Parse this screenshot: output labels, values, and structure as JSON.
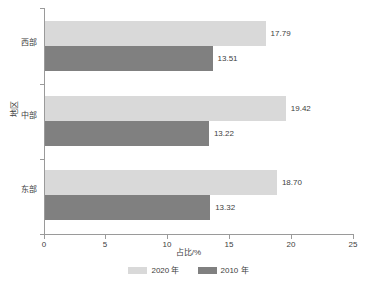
{
  "chart_data": {
    "type": "bar",
    "orientation": "horizontal",
    "title": "",
    "xlabel": "占比/%",
    "ylabel": "地区",
    "categories": [
      "西部",
      "中部",
      "东部"
    ],
    "category_order_top_to_bottom": [
      "西部",
      "中部",
      "东部"
    ],
    "series": [
      {
        "name": "2020 年",
        "color": "#d9d9d9",
        "values": [
          17.79,
          19.42,
          18.7
        ],
        "labels": [
          "17.79",
          "19.42",
          "18.70"
        ]
      },
      {
        "name": "2010 年",
        "color": "#808080",
        "values": [
          13.51,
          13.22,
          13.32
        ],
        "labels": [
          "13.51",
          "13.22",
          "13.32"
        ]
      }
    ],
    "xlim": [
      0,
      25
    ],
    "xticks": [
      0,
      5,
      10,
      15,
      20,
      25
    ],
    "xtick_labels": [
      "0",
      "5",
      "10",
      "15",
      "20",
      "25"
    ],
    "grid": false,
    "legend_position": "bottom-center"
  },
  "axes": {
    "y_title": "地区",
    "x_title": "占比/%",
    "x_ticks": [
      {
        "value": 0,
        "label": "0"
      },
      {
        "value": 5,
        "label": "5"
      },
      {
        "value": 10,
        "label": "10"
      },
      {
        "value": 15,
        "label": "15"
      },
      {
        "value": 20,
        "label": "20"
      },
      {
        "value": 25,
        "label": "25"
      }
    ],
    "categories": [
      {
        "label": "西部"
      },
      {
        "label": "中部"
      },
      {
        "label": "东部"
      }
    ]
  },
  "bars": [
    {
      "category": "西部",
      "series": "2020 年",
      "value": 17.79,
      "label": "17.79"
    },
    {
      "category": "西部",
      "series": "2010 年",
      "value": 13.51,
      "label": "13.51"
    },
    {
      "category": "中部",
      "series": "2020 年",
      "value": 19.42,
      "label": "19.42"
    },
    {
      "category": "中部",
      "series": "2010 年",
      "value": 13.22,
      "label": "13.22"
    },
    {
      "category": "东部",
      "series": "2020 年",
      "value": 18.7,
      "label": "18.70"
    },
    {
      "category": "东部",
      "series": "2010 年",
      "value": 13.32,
      "label": "13.32"
    }
  ],
  "legend": {
    "items": [
      {
        "label": "2020 年",
        "color": "#d9d9d9"
      },
      {
        "label": "2010 年",
        "color": "#808080"
      }
    ]
  },
  "colors": {
    "series_2020": "#d9d9d9",
    "series_2010": "#808080",
    "axis": "#9a9a9a",
    "text": "#404040",
    "background": "#ffffff"
  }
}
